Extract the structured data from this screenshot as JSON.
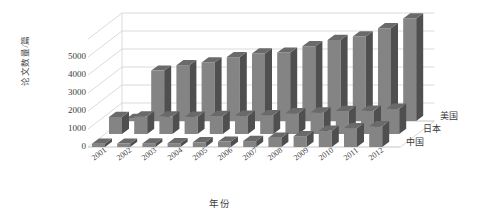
{
  "chart_data": {
    "type": "bar",
    "subtype": "3d-grouped-rows",
    "title": "",
    "xlabel": "年份",
    "ylabel": "论文数量/篇",
    "ylim": [
      0,
      6000
    ],
    "yticks": [
      0,
      1000,
      2000,
      3000,
      4000,
      5000
    ],
    "grid": true,
    "legend_position": "right-depth-axis",
    "categories": [
      "2001",
      "2002",
      "2003",
      "2004",
      "2005",
      "2006",
      "2007",
      "2008",
      "2009",
      "2010",
      "2011",
      "2012"
    ],
    "series": [
      {
        "name": "美国",
        "row": "back",
        "values": [
          120,
          2800,
          3100,
          3250,
          3550,
          3750,
          3800,
          4150,
          4500,
          4700,
          5150,
          5700
        ]
      },
      {
        "name": "日本",
        "row": "middle",
        "values": [
          950,
          980,
          980,
          960,
          1000,
          1020,
          1050,
          1150,
          1200,
          1280,
          1300,
          1400
        ]
      },
      {
        "name": "中国",
        "row": "front",
        "values": [
          180,
          190,
          200,
          210,
          260,
          300,
          330,
          520,
          600,
          900,
          1050,
          1150
        ]
      }
    ],
    "colors": {
      "bar_front": "#848484",
      "bar_side": "#4f4f4f",
      "bar_top": "#6a6a6a",
      "gridline": "#d2d2d2",
      "text": "#3c3c3c",
      "background": "#ffffff"
    }
  },
  "axes": {
    "y_title": "论文数量/篇",
    "x_title": "年份",
    "tick_labels": [
      "5000",
      "4000",
      "3000",
      "2000",
      "1000",
      "0"
    ]
  },
  "series_labels": [
    "美国",
    "日本",
    "中国"
  ]
}
